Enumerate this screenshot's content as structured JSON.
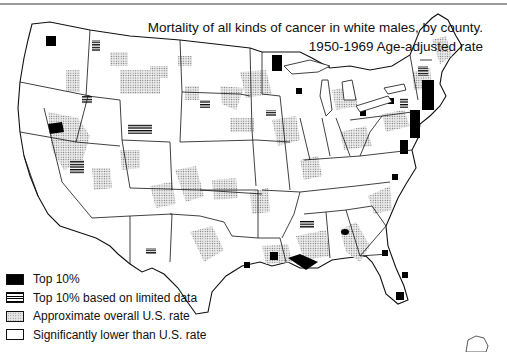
{
  "title": {
    "line1": "Mortality of all kinds of cancer in white males, by county.",
    "line2": "1950-1969 Age-adjusted rate"
  },
  "legend": {
    "items": [
      {
        "key": "top10",
        "pattern": "solid-black",
        "label": "Top 10%"
      },
      {
        "key": "top10_limited",
        "pattern": "horizontal-lines",
        "label": "Top 10% based on limited data"
      },
      {
        "key": "approx_us",
        "pattern": "stipple-dots",
        "label": "Approximate overall U.S. rate"
      },
      {
        "key": "lower",
        "pattern": "white",
        "label": "Significantly lower than U.S. rate"
      }
    ]
  },
  "colors": {
    "top10": "#000000",
    "stipple": "#bdbdbd",
    "outline": "#111111",
    "rule": "#9a9a9a",
    "background": "#ffffff"
  },
  "map": {
    "subject": "Contiguous United States, county-level choropleth",
    "notable_clusters_top10": [
      "Northeast seaboard (NJ/NY/MA/CT/RI)",
      "Southern Louisiana",
      "Northern Nevada",
      "Northeastern Minnesota",
      "Great Lakes shore counties",
      "South Florida"
    ]
  }
}
